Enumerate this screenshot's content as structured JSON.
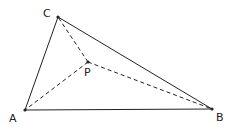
{
  "diagram": {
    "type": "triangle-with-interior-point",
    "points": {
      "A": {
        "x": 25,
        "y": 110,
        "label": "A"
      },
      "B": {
        "x": 212,
        "y": 109,
        "label": "B"
      },
      "C": {
        "x": 58,
        "y": 17,
        "label": "C"
      },
      "P": {
        "x": 88,
        "y": 62,
        "label": "P"
      }
    },
    "solid_edges": [
      [
        "A",
        "B"
      ],
      [
        "B",
        "C"
      ],
      [
        "C",
        "A"
      ]
    ],
    "dashed_edges": [
      [
        "P",
        "A"
      ],
      [
        "P",
        "B"
      ],
      [
        "P",
        "C"
      ]
    ],
    "colors": {
      "stroke": "#222222",
      "background": "#ffffff"
    }
  }
}
